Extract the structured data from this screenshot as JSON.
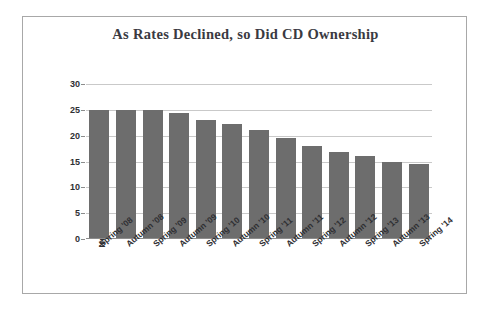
{
  "figure": {
    "title": "As Rates Declined, so Did CD Ownership",
    "border_color": "#a8a8a8",
    "background": "#ffffff"
  },
  "chart_data": {
    "type": "bar",
    "title": "As Rates Declined, so Did CD Ownership",
    "xlabel": "",
    "ylabel": "Number of people in millions",
    "categories": [
      "Spring '08",
      "Autumn '08",
      "Spring '09",
      "Autumn '09",
      "Spring '10",
      "Autumn '10",
      "Spring '11",
      "Autumn '11",
      "Spring '12",
      "Autumn '12",
      "Spring '13",
      "Autumn '13",
      "Spring '14"
    ],
    "values": [
      25.0,
      25.0,
      24.9,
      24.4,
      23.0,
      22.2,
      21.1,
      19.5,
      18.0,
      16.8,
      16.1,
      15.0,
      14.6
    ],
    "ylim": [
      0,
      30
    ],
    "yticks": [
      0,
      5,
      10,
      15,
      20,
      25,
      30
    ],
    "ytick_labels": [
      "0",
      "5",
      "10",
      "15",
      "20",
      "25",
      "30"
    ],
    "grid": true,
    "legend": false,
    "bar_color": "#6d6d6d",
    "gridline_color": "#c9c9c9"
  }
}
